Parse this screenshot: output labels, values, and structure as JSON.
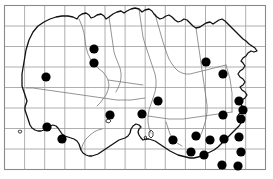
{
  "map": {
    "title": "Jersey distribution map",
    "description": "Outline map of Jersey with a square grid overlay and filled circular dots marking recorded occurrences",
    "width": 273,
    "height": 179,
    "background_color": "#ffffff"
  },
  "frame": {
    "name": "map-border",
    "x": 4.5,
    "y": 5.5,
    "width": 261,
    "height": 164,
    "stroke_color": "#8a8a8a",
    "stroke_width": 1.1
  },
  "grid": {
    "name": "grid-overlay",
    "columns": 13,
    "rows": 8,
    "cell_width": 20.1,
    "cell_height": 20.5,
    "origin_x": 4.5,
    "origin_y": 5.5,
    "stroke_color": "#9a9a9a",
    "stroke_width": 0.8,
    "visible": true,
    "x_positions": [
      24.6,
      44.7,
      64.8,
      84.9,
      105.0,
      125.1,
      145.2,
      165.3,
      185.4,
      205.5,
      225.6,
      245.7
    ],
    "y_positions": [
      26.0,
      46.5,
      67.0,
      87.5,
      108.0,
      128.5,
      149.0
    ]
  },
  "coastline": {
    "name": "island-coastline",
    "stroke_color": "#111111",
    "stroke_width": 1.3,
    "fill": "none",
    "path": "M 22 74 L 24 62 L 26 50 L 29 40 L 33 32 L 38 26 L 44 22 L 50 19 L 56 17 L 62 16 L 68 16 L 73 17 L 77 19 L 79 16 L 82 14 L 86 13 L 89 15 L 91 18 L 94 17 L 97 15 L 101 14 L 104 16 L 106 19 L 109 17 L 113 14 L 117 12 L 121 11 L 124 13 L 127 11 L 131 9 L 135 8 L 139 9 L 142 12 L 145 10 L 149 9 L 152 11 L 154 14 L 157 17 L 160 19 L 163 18 L 166 16 L 169 15 L 172 17 L 175 20 L 178 22 L 181 21 L 184 19 L 187 20 L 190 23 L 193 26 L 196 28 L 200 27 L 203 25 L 206 23 L 210 22 L 213 24 L 216 22 L 219 20 L 222 19 L 225 21 L 228 24 L 231 27 L 234 30 L 237 33 L 240 36 L 243 39 L 246 41 L 249 44 L 252 46 L 255 48 L 257 51 L 254 52 L 251 51 L 248 53 L 246 56 L 243 58 L 241 61 L 243 63 L 245 66 L 243 69 L 240 71 L 238 74 L 240 77 L 243 79 L 245 82 L 243 85 L 240 87 L 242 90 L 245 92 L 247 95 L 245 98 L 242 100 L 240 103 L 242 106 L 244 109 L 242 112 L 239 114 L 237 117 L 239 120 L 241 123 L 239 126 L 236 129 L 233 132 L 230 135 L 227 138 L 224 141 L 221 144 L 218 147 L 214 150 L 210 152 L 206 154 L 202 156 L 198 157 L 194 158 L 190 158 L 186 157 L 182 156 L 178 155 L 174 153 L 170 151 L 167 149 L 164 147 L 161 145 L 158 143 L 155 141 L 152 140 L 149 139 L 146 139 L 143 140 L 141 138 L 139 135 L 138 132 L 139 129 L 141 127 L 139 125 L 136 124 L 133 126 L 131 129 L 130 133 L 128 136 L 125 138 L 122 139 L 119 140 L 116 142 L 113 144 L 110 146 L 107 148 L 104 150 L 101 152 L 98 154 L 95 155 L 92 156 L 89 156 L 86 155 L 83 153 L 81 150 L 80 147 L 79 144 L 77 141 L 74 139 L 71 138 L 68 137 L 65 136 L 62 134 L 60 131 L 58 128 L 56 126 L 53 125 L 50 126 L 47 128 L 44 130 L 41 131 L 38 131 L 35 130 L 32 128 L 30 125 L 29 122 L 28 119 L 27 116 L 26 113 L 25 110 L 25 107 L 26 104 L 27 101 L 26 98 L 25 95 L 24 92 L 23 89 L 22 86 L 22 83 L 22 80 Z"
  },
  "inland_boundaries": {
    "name": "parish-boundaries",
    "stroke_color": "#7a7a7a",
    "stroke_width": 0.8,
    "fill": "none",
    "paths": [
      "M 79 19 L 82 26 L 84 33 L 85 40 L 86 47 L 88 54 L 91 60 L 95 65 L 99 69 L 103 72 L 106 76 L 108 80 L 109 85 L 108 90 L 106 95 L 103 99 L 100 103 L 97 106",
      "M 109 17 L 110 24 L 111 31 L 112 38 L 113 45 L 114 52 L 116 58 L 118 63 L 120 68 L 121 73 L 121 78 L 120 83 L 118 88 L 116 92",
      "M 139 9 L 140 16 L 141 23 L 142 30 L 143 37 L 145 44 L 147 50 L 149 56 L 151 62 L 153 68 L 155 74 L 156 80 L 156 86 L 155 92 L 153 98 L 151 104 L 149 110 L 148 116 L 148 122 L 149 128 L 151 133",
      "M 155 14 L 157 21 L 159 28 L 161 35 L 163 42 L 165 48 L 167 54 L 169 59 L 172 64 L 175 68 L 178 71 L 182 73 L 186 74 L 190 74 L 194 73 L 198 72 L 202 71 L 206 70 L 210 69 L 214 68 L 218 67 L 222 66 L 226 65",
      "M 196 28 L 197 35 L 198 42 L 199 49 L 200 56 L 201 63 L 202 70 L 203 77 L 204 84 L 205 91 L 206 98 L 207 105 L 207 112 L 206 119 L 204 126 L 202 132 L 199 138",
      "M 26 88 L 33 88 L 40 89 L 47 90 L 54 91 L 61 92 L 68 93 L 75 94 L 82 95 L 89 96 L 96 97 L 103 98 L 110 99 L 117 100 L 124 100 L 131 100 L 138 99 L 145 98",
      "M 148 116 L 155 117 L 162 118 L 169 119 L 176 119 L 183 119 L 190 118 L 197 117 L 204 116 L 211 115 L 218 114 L 225 113 L 232 112",
      "M 108 80 L 115 81 L 122 82 L 129 83 L 136 84 L 143 85",
      "M 226 65 L 228 72 L 230 79 L 231 86 L 232 93 L 232 100 L 232 107 L 232 112",
      "M 81 150 L 83 144 L 86 139 L 90 135 L 94 132 L 98 130 L 102 129",
      "M 166 122 L 168 128 L 170 134 L 173 139 L 177 143 L 182 146"
    ]
  },
  "islets": {
    "name": "offshore-rocks",
    "stroke_color": "#333333",
    "shapes": [
      "M 18 131 L 20 130 L 22 131 L 21 133 L 19 133 Z",
      "M 106 120 L 109 119 L 111 121 L 109 123 L 106 122 Z",
      "M 149 132 L 151 130 L 153 132 L 153 136 L 151 138 L 149 136 Z",
      "M 144 137 L 146 136 L 147 139 L 145 140 Z"
    ]
  },
  "dots": {
    "name": "occurrence-dots",
    "count": 24,
    "fill_color": "#000000",
    "radius": 4.6,
    "points": [
      {
        "id": 1,
        "x": 94,
        "y": 49,
        "label": "record-01"
      },
      {
        "id": 2,
        "x": 94,
        "y": 63,
        "label": "record-02"
      },
      {
        "id": 3,
        "x": 46,
        "y": 77,
        "label": "record-03"
      },
      {
        "id": 4,
        "x": 47,
        "y": 127,
        "label": "record-04"
      },
      {
        "id": 5,
        "x": 62,
        "y": 139,
        "label": "record-05"
      },
      {
        "id": 6,
        "x": 110,
        "y": 115,
        "label": "record-06"
      },
      {
        "id": 7,
        "x": 142,
        "y": 114,
        "label": "record-07"
      },
      {
        "id": 8,
        "x": 158,
        "y": 101,
        "label": "record-08"
      },
      {
        "id": 9,
        "x": 206,
        "y": 62,
        "label": "record-09"
      },
      {
        "id": 10,
        "x": 223,
        "y": 74,
        "label": "record-10"
      },
      {
        "id": 11,
        "x": 239,
        "y": 101,
        "label": "record-11"
      },
      {
        "id": 12,
        "x": 243,
        "y": 110,
        "label": "record-12"
      },
      {
        "id": 13,
        "x": 223,
        "y": 115,
        "label": "record-13"
      },
      {
        "id": 14,
        "x": 241,
        "y": 119,
        "label": "record-14"
      },
      {
        "id": 15,
        "x": 173,
        "y": 140,
        "label": "record-15"
      },
      {
        "id": 16,
        "x": 191,
        "y": 152,
        "label": "record-16"
      },
      {
        "id": 17,
        "x": 204,
        "y": 155,
        "label": "record-17"
      },
      {
        "id": 18,
        "x": 224,
        "y": 139,
        "label": "record-18"
      },
      {
        "id": 19,
        "x": 239,
        "y": 137,
        "label": "record-19"
      },
      {
        "id": 20,
        "x": 241,
        "y": 152,
        "label": "record-20"
      },
      {
        "id": 21,
        "x": 222,
        "y": 165,
        "label": "record-21"
      },
      {
        "id": 22,
        "x": 238,
        "y": 166,
        "label": "record-22"
      },
      {
        "id": 23,
        "x": 210,
        "y": 140,
        "label": "record-23"
      },
      {
        "id": 24,
        "x": 196,
        "y": 136,
        "label": "record-24"
      }
    ]
  }
}
